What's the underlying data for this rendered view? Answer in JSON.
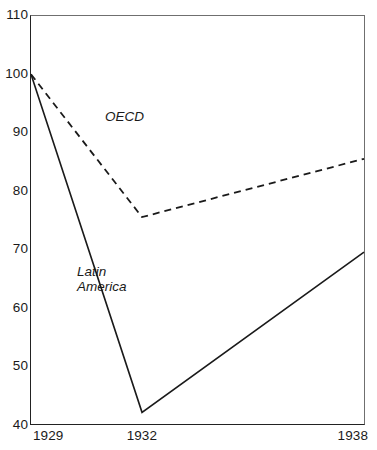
{
  "chart_data": {
    "type": "line",
    "title": "",
    "subtitle": "",
    "xlabel": "",
    "ylabel": "",
    "x": [
      1929,
      1932,
      1938
    ],
    "categories": [
      "1929",
      "1932",
      "1938"
    ],
    "xtick_labels": [
      "1929",
      "1932",
      "1938"
    ],
    "ytick_labels": [
      "110",
      "100",
      "90",
      "80",
      "70",
      "60",
      "50",
      "40"
    ],
    "yticks": [
      110,
      100,
      90,
      80,
      70,
      60,
      50,
      40
    ],
    "ylim": [
      40,
      110
    ],
    "xlim": [
      1929,
      1938
    ],
    "grid": false,
    "legend_position": "inline-annotation",
    "series": [
      {
        "name": "OECD",
        "label": "OECD",
        "style": "dashed",
        "color": "#1a1a1a",
        "values": [
          100,
          75.5,
          85.5
        ]
      },
      {
        "name": "Latin America",
        "label": "Latin\nAmerica",
        "style": "solid",
        "color": "#1a1a1a",
        "values": [
          100,
          42,
          69.5
        ]
      }
    ]
  },
  "axes": {
    "y_labels": [
      {
        "value": 110,
        "text": "110"
      },
      {
        "value": 100,
        "text": "100"
      },
      {
        "value": 90,
        "text": "90"
      },
      {
        "value": 80,
        "text": "80"
      },
      {
        "value": 70,
        "text": "70"
      },
      {
        "value": 60,
        "text": "60"
      },
      {
        "value": 50,
        "text": "50"
      },
      {
        "value": 40,
        "text": "40"
      }
    ],
    "x_labels": [
      {
        "value": 1929,
        "text": "1929"
      },
      {
        "value": 1932,
        "text": "1932"
      },
      {
        "value": 1938,
        "text": "1938"
      }
    ]
  },
  "annotations": {
    "oecd": "OECD",
    "latin_america": "Latin\nAmerica"
  },
  "colors": {
    "line": "#1a1a1a",
    "axis": "#222222",
    "frame_light": "#6f6f6f",
    "background": "#ffffff"
  }
}
